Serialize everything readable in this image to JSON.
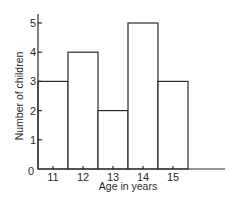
{
  "chart_data": {
    "type": "bar",
    "subtype": "histogram",
    "title": "",
    "xlabel": "Age in years",
    "ylabel": "Number of children",
    "categories": [
      "11",
      "12",
      "13",
      "14",
      "15"
    ],
    "values": [
      3,
      4,
      2,
      5,
      3
    ],
    "x_ticks": [
      "11",
      "12",
      "13",
      "14",
      "15"
    ],
    "y_ticks": [
      "1",
      "2",
      "3",
      "4",
      "5"
    ],
    "origin_label": "0",
    "ylim": [
      0,
      5
    ],
    "grid": false,
    "legend": null,
    "bar_fill": "#ffffff",
    "bar_stroke": "#2a2a2a"
  }
}
